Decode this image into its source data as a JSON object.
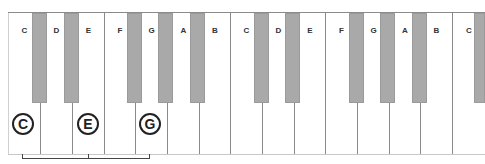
{
  "diagram": {
    "white_keys": [
      "C",
      "D",
      "E",
      "F",
      "G",
      "A",
      "B",
      "C",
      "D",
      "E",
      "F",
      "G",
      "A",
      "B",
      "C"
    ],
    "highlighted": [
      "C",
      "E",
      "G"
    ],
    "colors": {
      "white_key": "#ffffff",
      "black_key": "#a9a9a9",
      "outline": "#8a8a8a",
      "circle": "#222222"
    }
  }
}
